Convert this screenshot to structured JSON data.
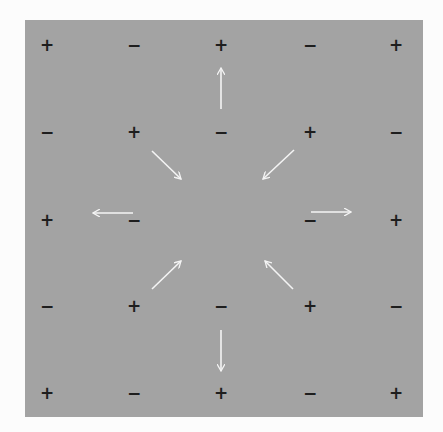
{
  "diagram": {
    "background_color": "#fcfcfc",
    "panel_color": "#a3a3a3",
    "sign_color": "#1e1e1e",
    "arrow_color": "#f4f4f4",
    "grid": {
      "rows": 5,
      "cols": 5,
      "x_positions": [
        47,
        134,
        221,
        310,
        396
      ],
      "y_positions": [
        45,
        132,
        220,
        306,
        393
      ],
      "signs": [
        [
          "+",
          "−",
          "+",
          "−",
          "+"
        ],
        [
          "−",
          "+",
          "−",
          "+",
          "−"
        ],
        [
          "+",
          "−",
          "",
          "−",
          "+"
        ],
        [
          "−",
          "+",
          "−",
          "+",
          "−"
        ],
        [
          "+",
          "−",
          "+",
          "−",
          "+"
        ]
      ]
    },
    "arrows": [
      {
        "name": "arrow-up",
        "x1": 221,
        "y1": 109,
        "x2": 221,
        "y2": 68
      },
      {
        "name": "arrow-down",
        "x1": 221,
        "y1": 330,
        "x2": 221,
        "y2": 371
      },
      {
        "name": "arrow-left",
        "x1": 133,
        "y1": 213,
        "x2": 93,
        "y2": 213
      },
      {
        "name": "arrow-right",
        "x1": 311,
        "y1": 212,
        "x2": 351,
        "y2": 212
      },
      {
        "name": "arrow-upper-left-inward",
        "x1": 152,
        "y1": 151,
        "x2": 181,
        "y2": 179
      },
      {
        "name": "arrow-upper-right-inward",
        "x1": 294,
        "y1": 150,
        "x2": 263,
        "y2": 179
      },
      {
        "name": "arrow-lower-left-inward",
        "x1": 152,
        "y1": 289,
        "x2": 181,
        "y2": 261
      },
      {
        "name": "arrow-lower-right-inward",
        "x1": 293,
        "y1": 289,
        "x2": 265,
        "y2": 261
      }
    ]
  }
}
